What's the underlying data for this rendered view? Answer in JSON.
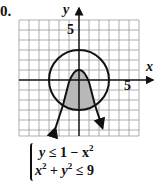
{
  "problem_number": "0.",
  "axes": {
    "x_label": "x",
    "y_label": "y",
    "x_tick_label": "5",
    "y_tick_label": "5",
    "x_range": [
      -6,
      6
    ],
    "y_range": [
      -5.6,
      6
    ]
  },
  "curves": [
    {
      "name": "parabola",
      "equation": "y = 1 - x^2",
      "vertex": [
        0,
        1
      ],
      "style": "solid"
    },
    {
      "name": "circle",
      "equation": "x^2 + y^2 = 9",
      "center": [
        0,
        0
      ],
      "radius": 3,
      "style": "solid"
    }
  ],
  "shaded_region": "inside circle and below parabola",
  "system": {
    "line1": {
      "lhs": "y",
      "op": "≤",
      "rhs": "1 − x",
      "exp": "2"
    },
    "line2": {
      "a": "x",
      "a_exp": "2",
      "plus": " + ",
      "b": "y",
      "b_exp": "2",
      "op": " ≤ 9"
    }
  },
  "colors": {
    "ink": "#111111",
    "grid": "#9a9a9a",
    "shade": "#b8b8b8"
  }
}
